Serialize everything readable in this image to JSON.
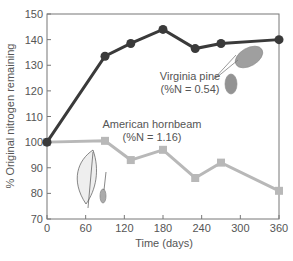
{
  "chart_data": {
    "type": "line",
    "title": "",
    "xlabel": "Time (days)",
    "ylabel": "% Original nitrogen remaining",
    "xlim": [
      0,
      360
    ],
    "ylim": [
      70,
      150
    ],
    "xticks": [
      0,
      60,
      120,
      180,
      240,
      300,
      360
    ],
    "yticks": [
      70,
      80,
      90,
      100,
      110,
      120,
      130,
      140,
      150
    ],
    "grid": false,
    "legend": "inline annotations",
    "series": [
      {
        "name": "Virginia pine",
        "annotation": "(%N = 0.54)",
        "color": "#3a3a3a",
        "marker": "circle",
        "x": [
          0,
          90,
          130,
          180,
          230,
          270,
          360
        ],
        "y": [
          100,
          133.5,
          138.5,
          144,
          136.5,
          138.5,
          140
        ]
      },
      {
        "name": "American hornbeam",
        "annotation": "(%N = 1.16)",
        "color": "#b8b8b8",
        "marker": "square",
        "x": [
          0,
          90,
          130,
          180,
          230,
          270,
          360
        ],
        "y": [
          100,
          100.5,
          93,
          97,
          86,
          92,
          81
        ]
      }
    ]
  },
  "labels": {
    "pine_name": "Virginia pine",
    "pine_note": "(%N = 0.54)",
    "hornbeam_name": "American hornbeam",
    "hornbeam_note": "(%N = 1.16)",
    "xlabel": "Time (days)",
    "ylabel": "% Original nitrogen remaining"
  }
}
